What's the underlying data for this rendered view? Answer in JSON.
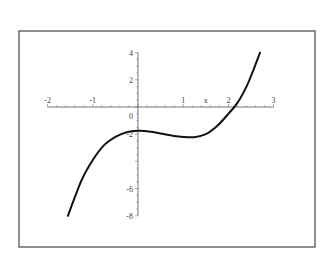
{
  "chart_data": {
    "type": "line",
    "title": "",
    "xlabel": "x",
    "ylabel": "",
    "xlim": [
      -2,
      3
    ],
    "ylim": [
      -8,
      4
    ],
    "grid": false,
    "legend": null,
    "x_ticks": [
      "-2",
      "-1",
      "1",
      "x",
      "2",
      "3"
    ],
    "y_ticks": [
      "4",
      "2",
      "0",
      "-2",
      "-6",
      "-8"
    ],
    "series": [
      {
        "name": "f(x)",
        "x": [
          -1.55,
          -1.25,
          -1.0,
          -0.75,
          -0.5,
          -0.25,
          0.0,
          0.25,
          0.5,
          0.75,
          1.0,
          1.25,
          1.5,
          1.75,
          2.0,
          2.2,
          2.4,
          2.55,
          2.7
        ],
        "values": [
          -8.0,
          -5.4,
          -3.9,
          -2.8,
          -2.2,
          -1.85,
          -1.75,
          -1.8,
          -1.95,
          -2.1,
          -2.2,
          -2.22,
          -2.0,
          -1.4,
          -0.5,
          0.3,
          1.5,
          2.7,
          4.0
        ]
      }
    ],
    "colors": {
      "curve": "#111111",
      "axis": "#555555",
      "frame": "#444444"
    }
  }
}
